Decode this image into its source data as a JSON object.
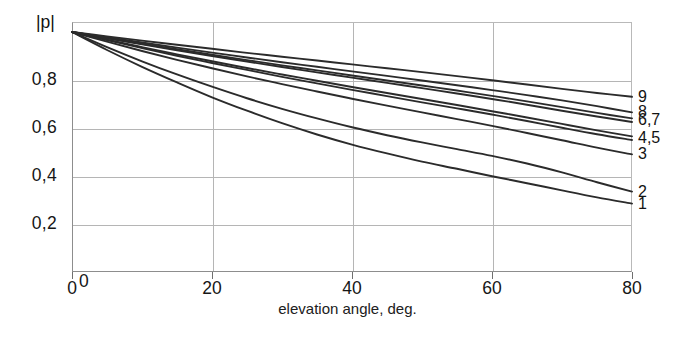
{
  "chart_data": {
    "type": "line",
    "title": "",
    "xlabel": "elevation angle, deg.",
    "ylabel": "|p|",
    "xlim": [
      0,
      80
    ],
    "ylim": [
      0,
      1.0
    ],
    "grid": true,
    "legend_position": "right-end-of-curve",
    "x_ticks": [
      "0",
      "20",
      "40",
      "60",
      "80"
    ],
    "x_tick_values": [
      0,
      20,
      40,
      60,
      80
    ],
    "y_ticks": [
      "0",
      "0,2",
      "0,4",
      "0,6",
      "0,8"
    ],
    "y_tick_values": [
      0,
      0.2,
      0.4,
      0.6,
      0.8
    ],
    "x": [
      0,
      5,
      10,
      15,
      20,
      25,
      30,
      35,
      40,
      45,
      50,
      55,
      60,
      65,
      70,
      75,
      80
    ],
    "series": [
      {
        "name": "1",
        "label": "1",
        "values": [
          1.0,
          0.925,
          0.855,
          0.79,
          0.728,
          0.672,
          0.62,
          0.573,
          0.531,
          0.494,
          0.46,
          0.43,
          0.399,
          0.37,
          0.34,
          0.311,
          0.285
        ]
      },
      {
        "name": "2",
        "label": "2",
        "values": [
          1.0,
          0.937,
          0.878,
          0.823,
          0.772,
          0.724,
          0.68,
          0.64,
          0.603,
          0.57,
          0.54,
          0.512,
          0.484,
          0.452,
          0.415,
          0.374,
          0.335
        ]
      },
      {
        "name": "3",
        "label": "3",
        "values": [
          1.0,
          0.96,
          0.921,
          0.884,
          0.849,
          0.815,
          0.783,
          0.752,
          0.722,
          0.693,
          0.665,
          0.637,
          0.609,
          0.579,
          0.549,
          0.518,
          0.49
        ]
      },
      {
        "name": "4",
        "label": "4",
        "values": [
          1.0,
          0.966,
          0.933,
          0.901,
          0.871,
          0.842,
          0.813,
          0.786,
          0.759,
          0.733,
          0.707,
          0.682,
          0.656,
          0.629,
          0.601,
          0.574,
          0.55
        ]
      },
      {
        "name": "5",
        "label": "5",
        "values": [
          1.0,
          0.968,
          0.937,
          0.907,
          0.878,
          0.85,
          0.823,
          0.797,
          0.771,
          0.746,
          0.721,
          0.696,
          0.67,
          0.644,
          0.617,
          0.59,
          0.565
        ]
      },
      {
        "name": "6",
        "label": "6",
        "values": [
          1.0,
          0.974,
          0.949,
          0.924,
          0.9,
          0.877,
          0.854,
          0.832,
          0.81,
          0.788,
          0.766,
          0.744,
          0.721,
          0.697,
          0.672,
          0.648,
          0.625
        ]
      },
      {
        "name": "7",
        "label": "7",
        "values": [
          1.0,
          0.975,
          0.951,
          0.928,
          0.905,
          0.883,
          0.861,
          0.84,
          0.819,
          0.798,
          0.777,
          0.756,
          0.734,
          0.711,
          0.687,
          0.663,
          0.64
        ]
      },
      {
        "name": "8",
        "label": "8",
        "values": [
          1.0,
          0.978,
          0.956,
          0.935,
          0.914,
          0.894,
          0.874,
          0.855,
          0.836,
          0.817,
          0.798,
          0.778,
          0.758,
          0.737,
          0.715,
          0.691,
          0.665
        ]
      },
      {
        "name": "9",
        "label": "9",
        "values": [
          1.0,
          0.982,
          0.964,
          0.947,
          0.93,
          0.913,
          0.897,
          0.881,
          0.865,
          0.849,
          0.833,
          0.816,
          0.799,
          0.781,
          0.763,
          0.746,
          0.73
        ]
      }
    ],
    "curve_end_labels": [
      {
        "text": "9",
        "value": 0.73
      },
      {
        "text": "8",
        "value": 0.665
      },
      {
        "text": "6,7",
        "value": 0.632
      },
      {
        "text": "4,5",
        "value": 0.557
      },
      {
        "text": "3",
        "value": 0.49
      },
      {
        "text": "2",
        "value": 0.335
      },
      {
        "text": "1",
        "value": 0.285
      }
    ]
  },
  "colors": {
    "curve": "#2b2b2b",
    "grid": "#b5b5b5",
    "axis": "#8d8d8d",
    "text": "#161616",
    "background": "#ffffff"
  }
}
